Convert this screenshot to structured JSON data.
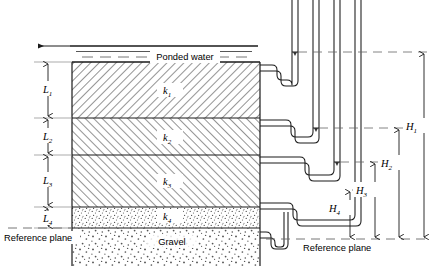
{
  "figure": {
    "type": "soil-permeability-cross-section",
    "ponded_water_label": "Ponded water",
    "gravel_label": "Gravel",
    "reference_plane_label_left": "Reference plane",
    "reference_plane_label_right": "Reference plane"
  },
  "layers": [
    {
      "thickness_label": "L",
      "thickness_sub": "1",
      "perm_label": "k",
      "perm_sub": "1",
      "pattern": "hatch-right",
      "top": 62,
      "bottom": 118
    },
    {
      "thickness_label": "L",
      "thickness_sub": "2",
      "perm_label": "k",
      "perm_sub": "2",
      "pattern": "hatch-left",
      "top": 118,
      "bottom": 155
    },
    {
      "thickness_label": "L",
      "thickness_sub": "3",
      "perm_label": "k",
      "perm_sub": "3",
      "pattern": "hatch-left",
      "top": 155,
      "bottom": 207
    },
    {
      "thickness_label": "L",
      "thickness_sub": "4",
      "perm_label": "k",
      "perm_sub": "4",
      "pattern": "stipple-fine",
      "top": 207,
      "bottom": 228
    }
  ],
  "gravel": {
    "pattern": "stipple-coarse",
    "top": 228,
    "bottom": 266
  },
  "heads": [
    {
      "label": "H",
      "sub": "1",
      "level_y": 52,
      "text_x": 411,
      "text_y": 128
    },
    {
      "label": "H",
      "sub": "2",
      "level_y": 128,
      "text_x": 381,
      "text_y": 165
    },
    {
      "label": "H",
      "sub": "3",
      "level_y": 162,
      "text_x": 355,
      "text_y": 192
    },
    {
      "label": "H",
      "sub": "4",
      "level_y": 190,
      "text_x": 330,
      "text_y": 209
    }
  ],
  "reference_plane_y": 228,
  "colors": {
    "line": "#1a1a1a",
    "hatch": "#3a3a3a",
    "stipple": "#555555",
    "dashed": "#666666",
    "background": "#ffffff"
  }
}
